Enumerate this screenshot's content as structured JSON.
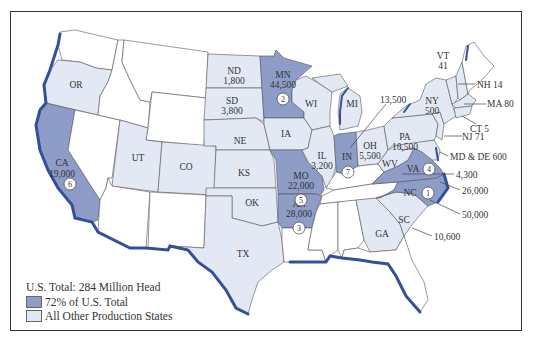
{
  "colors": {
    "top": "#8e9cc8",
    "other": "#e3e9f4",
    "none": "#ffffff",
    "coast": "#34509a",
    "border": "#555555"
  },
  "legend": {
    "total": "U.S. Total: 284 Million Head",
    "top_label": "72% of U.S. Total",
    "other_label": "All Other Production States"
  },
  "states": {
    "OR": {
      "label": "OR",
      "value": "",
      "group": "other"
    },
    "CA": {
      "label": "CA",
      "value": "19,000",
      "group": "top",
      "rank": "6"
    },
    "UT": {
      "label": "UT",
      "value": "",
      "group": "other"
    },
    "CO": {
      "label": "CO",
      "value": "",
      "group": "other"
    },
    "ND": {
      "label": "ND",
      "value": "1,800",
      "group": "other"
    },
    "SD": {
      "label": "SD",
      "value": "3,800",
      "group": "other"
    },
    "NE": {
      "label": "NE",
      "value": "",
      "group": "other"
    },
    "KS": {
      "label": "KS",
      "value": "",
      "group": "other"
    },
    "OK": {
      "label": "OK",
      "value": "",
      "group": "other"
    },
    "TX": {
      "label": "TX",
      "value": "",
      "group": "other"
    },
    "MN": {
      "label": "MN",
      "value": "44,500",
      "group": "top",
      "rank": "2"
    },
    "IA": {
      "label": "IA",
      "value": "",
      "group": "other"
    },
    "MO": {
      "label": "MO",
      "value": "22,000",
      "group": "top",
      "rank": "5"
    },
    "AR": {
      "label": "AR",
      "value": "28,000",
      "group": "top",
      "rank": "3"
    },
    "WI": {
      "label": "WI",
      "value": "",
      "group": "other"
    },
    "IL": {
      "label": "IL",
      "value": "3,200",
      "group": "other"
    },
    "MI": {
      "label": "MI",
      "value": "13,500",
      "group": "other"
    },
    "IN": {
      "label": "IN",
      "value": "",
      "group": "top",
      "rank": "7"
    },
    "OH": {
      "label": "OH",
      "value": "5,500",
      "group": "other"
    },
    "WV": {
      "label": "WV",
      "value": "",
      "group": "other"
    },
    "VA": {
      "label": "VA",
      "value": "",
      "group": "top",
      "rank": "4"
    },
    "NC": {
      "label": "NC",
      "value": "",
      "group": "top",
      "rank": "1"
    },
    "SC": {
      "label": "SC",
      "value": "10,600",
      "group": "other"
    },
    "GA": {
      "label": "GA",
      "value": "",
      "group": "other"
    },
    "PA": {
      "label": "PA",
      "value": "10,500",
      "group": "other"
    },
    "NY": {
      "label": "NY",
      "value": "500",
      "group": "other"
    },
    "VT": {
      "label": "VT",
      "value": "41",
      "group": "other"
    },
    "NH": {
      "label": "NH 14",
      "group": "other"
    },
    "MA": {
      "label": "MA 80",
      "group": "other"
    },
    "CT": {
      "label": "CT 5",
      "group": "other"
    },
    "NJ": {
      "label": "NJ 71",
      "group": "other"
    },
    "MDDE": {
      "label": "MD & DE 600",
      "group": "other"
    }
  },
  "callouts": {
    "IN_value": "13,500",
    "VA_value": "4,300",
    "WV_value": "26,000",
    "NC_value": "50,000",
    "SC_value": "10,600"
  }
}
